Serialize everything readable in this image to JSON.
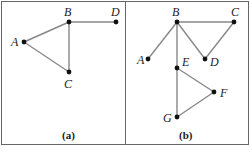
{
  "panels": [
    {
      "caption": "(a)",
      "nodes": [
        {
          "id": "A",
          "x": 24,
          "y": 42,
          "lx": 11,
          "ly": 46
        },
        {
          "id": "B",
          "x": 69,
          "y": 22,
          "lx": 64,
          "ly": 16
        },
        {
          "id": "C",
          "x": 69,
          "y": 72,
          "lx": 64,
          "ly": 88
        },
        {
          "id": "D",
          "x": 116,
          "y": 22,
          "lx": 111,
          "ly": 16
        }
      ],
      "edges": [
        [
          "A",
          "B"
        ],
        [
          "A",
          "C"
        ],
        [
          "B",
          "C"
        ],
        [
          "B",
          "D"
        ]
      ]
    },
    {
      "caption": "(b)",
      "nodes": [
        {
          "id": "A",
          "x": 148,
          "y": 59,
          "lx": 137,
          "ly": 64
        },
        {
          "id": "B",
          "x": 177,
          "y": 22,
          "lx": 172,
          "ly": 16
        },
        {
          "id": "C",
          "x": 234,
          "y": 22,
          "lx": 231,
          "ly": 16
        },
        {
          "id": "D",
          "x": 205,
          "y": 59,
          "lx": 210,
          "ly": 66
        },
        {
          "id": "E",
          "x": 177,
          "y": 68,
          "lx": 182,
          "ly": 66
        },
        {
          "id": "F",
          "x": 214,
          "y": 92,
          "lx": 220,
          "ly": 97
        },
        {
          "id": "G",
          "x": 177,
          "y": 117,
          "lx": 163,
          "ly": 122
        }
      ],
      "edges": [
        [
          "B",
          "A"
        ],
        [
          "B",
          "C"
        ],
        [
          "B",
          "D"
        ],
        [
          "C",
          "D"
        ],
        [
          "B",
          "E"
        ],
        [
          "E",
          "F"
        ],
        [
          "E",
          "G"
        ],
        [
          "F",
          "G"
        ]
      ]
    }
  ]
}
